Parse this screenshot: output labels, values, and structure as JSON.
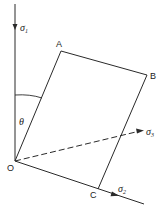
{
  "diagram": {
    "type": "stress-axes-plane-diagram",
    "colors": {
      "line": "#2a2a2a",
      "background": "#ffffff"
    },
    "points": {
      "O": {
        "label": "O",
        "x": 15,
        "y": 161
      },
      "A": {
        "label": "A",
        "x": 61,
        "y": 51
      },
      "B": {
        "label": "B",
        "x": 147,
        "y": 75
      },
      "C": {
        "label": "C",
        "x": 98,
        "y": 189
      }
    },
    "axes": [
      {
        "name": "sigma1",
        "symbol": "σ",
        "subscript": "1",
        "direction": "vertical",
        "style": "solid"
      },
      {
        "name": "sigma2",
        "symbol": "σ",
        "subscript": "2",
        "direction": "down-right",
        "style": "solid"
      },
      {
        "name": "sigma3",
        "symbol": "σ",
        "subscript": "3",
        "direction": "right-up",
        "style": "dashed"
      }
    ],
    "angle": {
      "symbol": "θ",
      "between": [
        "sigma1",
        "OA"
      ]
    }
  }
}
